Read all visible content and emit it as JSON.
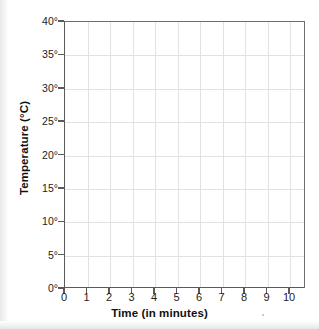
{
  "chart_data": {
    "type": "line",
    "title": "",
    "subtitle": "",
    "xlabel": "Time (in minutes)",
    "ylabel": "Temperature (°C)",
    "xlim": [
      0,
      10
    ],
    "ylim": [
      0,
      40
    ],
    "x_ticks": [
      "0",
      "1",
      "2",
      "3",
      "4",
      "5",
      "6",
      "7",
      "8",
      "9",
      "10"
    ],
    "x_tick_values": [
      0,
      1,
      2,
      3,
      4,
      5,
      6,
      7,
      8,
      9,
      10
    ],
    "y_ticks": [
      "0°",
      "5°",
      "10°",
      "15°",
      "20°",
      "25°",
      "30°",
      "35°",
      "40°"
    ],
    "y_tick_values": [
      0,
      5,
      10,
      15,
      20,
      25,
      30,
      35,
      40
    ],
    "grid": true,
    "legend": false,
    "legend_position": "none",
    "series": [],
    "values": [],
    "annotations": [],
    "note": "Empty grid; no data plotted"
  },
  "style": {
    "grid_color": "#e2e2e2",
    "axis_color": "#5a5a5a",
    "frame_color": "#6d6d6d",
    "text_color": "#1c1c1c",
    "title_color": "#111111",
    "plot_background": "#ffffff",
    "page_background": "#ffffff"
  }
}
